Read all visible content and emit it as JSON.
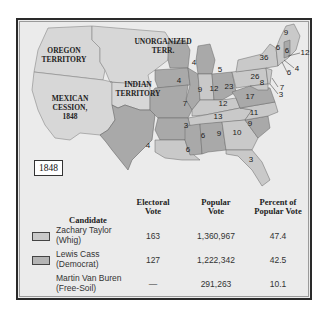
{
  "year": "1848",
  "colors": {
    "whig": "#c9c9c9",
    "democrat": "#a9a9a9",
    "territory": "#d7d7d7",
    "background": "#ebebeb"
  },
  "territory_labels": {
    "oregon": [
      "OREGON",
      "TERRITORY"
    ],
    "unorganized": [
      "UNORGANIZED",
      "TERR."
    ],
    "indian": [
      "INDIAN",
      "TERRITORY"
    ],
    "mexican": [
      "MEXICAN",
      "CESSION,",
      "1848"
    ]
  },
  "electoral_votes_on_map": [
    {
      "state": "Texas",
      "votes": "4"
    },
    {
      "state": "Wisconsin",
      "votes": "4"
    },
    {
      "state": "Michigan",
      "votes": "5"
    },
    {
      "state": "Iowa",
      "votes": "4"
    },
    {
      "state": "Illinois",
      "votes": "9"
    },
    {
      "state": "Indiana",
      "votes": "12"
    },
    {
      "state": "Ohio",
      "votes": "23"
    },
    {
      "state": "Missouri",
      "votes": "7"
    },
    {
      "state": "Kentucky",
      "votes": "12"
    },
    {
      "state": "Tennessee",
      "votes": "13"
    },
    {
      "state": "Arkansas",
      "votes": "3"
    },
    {
      "state": "Louisiana",
      "votes": "6"
    },
    {
      "state": "Mississippi",
      "votes": "6"
    },
    {
      "state": "Alabama",
      "votes": "9"
    },
    {
      "state": "Georgia",
      "votes": "10"
    },
    {
      "state": "South Carolina",
      "votes": "9"
    },
    {
      "state": "North Carolina",
      "votes": "11"
    },
    {
      "state": "Virginia",
      "votes": "17"
    },
    {
      "state": "Florida",
      "votes": "3"
    },
    {
      "state": "Pennsylvania",
      "votes": "26"
    },
    {
      "state": "New York",
      "votes": "36"
    },
    {
      "state": "Maryland",
      "votes": "8"
    },
    {
      "state": "Maine",
      "votes": "9"
    },
    {
      "state": "Vermont",
      "votes": "6"
    },
    {
      "state": "New Hampshire",
      "votes": "6"
    },
    {
      "state": "Massachusetts",
      "votes": "12"
    },
    {
      "state": "Rhode Island",
      "votes": "4"
    },
    {
      "state": "Connecticut",
      "votes": "6"
    },
    {
      "state": "New Jersey",
      "votes": "7"
    },
    {
      "state": "Delaware",
      "votes": "3"
    }
  ],
  "table": {
    "headers": {
      "candidate": "Candidate",
      "electoral": [
        "Electoral",
        "Vote"
      ],
      "popular": [
        "Popular",
        "Vote"
      ],
      "percent": [
        "Percent of",
        "Popular Vote"
      ]
    },
    "rows": [
      {
        "name": "Zachary Taylor",
        "party": "(Whig)",
        "electoral": "163",
        "popular": "1,360,967",
        "percent": "47.4",
        "swatch": "whig"
      },
      {
        "name": "Lewis Cass",
        "party": "(Democrat)",
        "electoral": "127",
        "popular": "1,222,342",
        "percent": "42.5",
        "swatch": "democrat"
      },
      {
        "name": "Martin Van Buren",
        "party": "(Free-Soil)",
        "electoral": "—",
        "popular": "291,263",
        "percent": "10.1",
        "swatch": null
      }
    ]
  }
}
